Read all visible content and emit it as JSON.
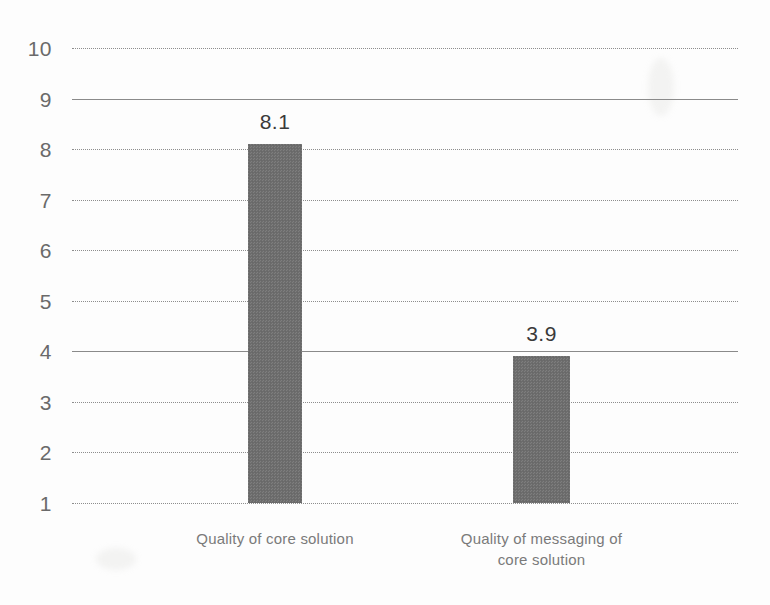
{
  "chart_data": {
    "type": "bar",
    "title": "",
    "subtitle": "",
    "xlabel": "",
    "ylabel": "",
    "categories": [
      "Quality of core solution",
      "Quality of messaging of\ncore solution"
    ],
    "values": [
      8.1,
      3.9
    ],
    "value_labels": [
      "8.1",
      "3.9"
    ],
    "ylim": [
      1,
      10
    ],
    "yticks": [
      10,
      9,
      8,
      7,
      6,
      5,
      4,
      3,
      2,
      1
    ],
    "ytick_labels": [
      "10",
      "9",
      "8",
      "7",
      "6",
      "5",
      "4",
      "3",
      "2",
      "1"
    ],
    "gridline_styles": [
      "dotted",
      "solid",
      "dotted",
      "dotted",
      "dotted",
      "dotted",
      "solid",
      "dotted",
      "dotted",
      "dotted"
    ],
    "grid": true,
    "legend": "none",
    "bar_color": "#6e6e6e",
    "gridline_color": "#8d8d8d",
    "tick_label_color": "#6a6a6a",
    "value_label_color": "#3a3a3a",
    "category_label_color": "#7a7a7a",
    "background_color": "#fdfdfd"
  }
}
